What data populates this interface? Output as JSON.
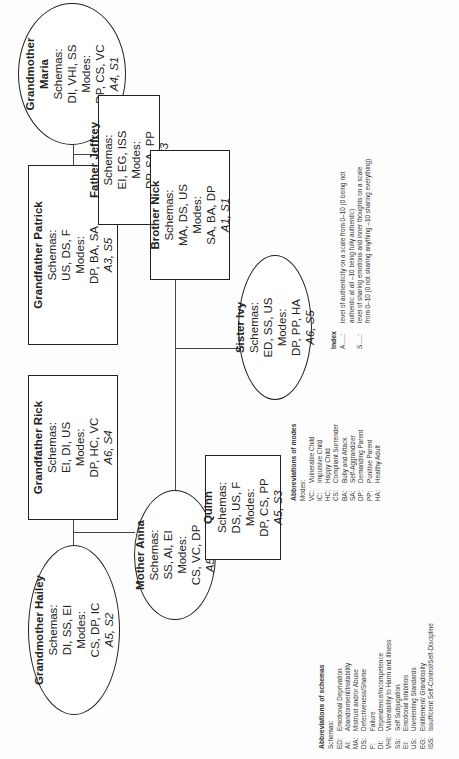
{
  "figure": {
    "members": [
      {
        "id": "hailey",
        "name": "Grandmother Hailey",
        "schemas_label": "Schemas:",
        "schemas": "DI, SS, EI",
        "modes_label": "Modes:",
        "modes": "CS, DP, IC",
        "score": "A5, S2",
        "shape": "ellipse"
      },
      {
        "id": "rick",
        "name": "Grandfather Rick",
        "schemas_label": "Schemas:",
        "schemas": "EI, DI, US",
        "modes_label": "Modes:",
        "modes": "DP, HC, VC",
        "score": "A6, S4",
        "shape": "box"
      },
      {
        "id": "patrick",
        "name": "Grandfather Patrick",
        "schemas_label": "Schemas:",
        "schemas": "US, DS, F",
        "modes_label": "Modes:",
        "modes": "DP, BA, SA",
        "score": "A3, S5",
        "shape": "box"
      },
      {
        "id": "maria",
        "name": "Grandmother Maria",
        "schemas_label": "Schemas:",
        "schemas": "DI, VHI, SS",
        "modes_label": "Modes:",
        "modes": "DP, CS, VC",
        "score": "A4, S1",
        "shape": "ellipse"
      },
      {
        "id": "anna",
        "name": "Mother Anna",
        "schemas_label": "Schemas:",
        "schemas": "SS, AI, EI",
        "modes_label": "Modes:",
        "modes": "CS, VC, DP",
        "score": "A5, S4",
        "shape": "ellipse"
      },
      {
        "id": "jeffrey",
        "name": "Father Jeffrey",
        "schemas_label": "Schemas:",
        "schemas": "EI, EG, ISS",
        "modes_label": "Modes:",
        "modes": "DP, SA, PP",
        "score": "A2, S3",
        "shape": "box"
      },
      {
        "id": "quinn",
        "name": "Quinn",
        "schemas_label": "Schemas:",
        "schemas": "DS, US, F",
        "modes_label": "Modes:",
        "modes": "DP, CS, PP",
        "score": "A5, S3",
        "shape": "box"
      },
      {
        "id": "ivy",
        "name": "Sister Ivy",
        "schemas_label": "Schemas:",
        "schemas": "ED, SS, US",
        "modes_label": "Modes:",
        "modes": "DP, PP, HA",
        "score": "A6, S5",
        "shape": "ellipse"
      },
      {
        "id": "nick",
        "name": "Brother Nick",
        "schemas_label": "Schemas:",
        "schemas": "MA, DS, US",
        "modes_label": "Modes:",
        "modes": "SA, BA, DP",
        "score": "A1, S1",
        "shape": "box"
      }
    ]
  },
  "legend_schemas": {
    "title": "Abbreviations of schemas",
    "subtitle": "Schemas:",
    "items": [
      {
        "abbr": "ED:",
        "label": "Emotional Deprivation"
      },
      {
        "abbr": "AI:",
        "label": "Abandonment/Instability"
      },
      {
        "abbr": "MA:",
        "label": "Mistrust and/or Abuse"
      },
      {
        "abbr": "DS:",
        "label": "Defectiveness/Shame"
      },
      {
        "abbr": "F:",
        "label": "Failure"
      },
      {
        "abbr": "DI:",
        "label": "Dependence/Incompetence"
      },
      {
        "abbr": "VHI:",
        "label": "Vulnerability to Harm and Illness"
      },
      {
        "abbr": "SS:",
        "label": "Self Subjugation"
      },
      {
        "abbr": "EI:",
        "label": "Emotional Inhibition"
      },
      {
        "abbr": "US:",
        "label": "Unrelenting Standards"
      },
      {
        "abbr": "EG:",
        "label": "Entitlement/ Grandiosity"
      },
      {
        "abbr": "ISS:",
        "label": "Issufficient Self-Control/Self-Discipline"
      }
    ]
  },
  "legend_modes": {
    "title": "Abbreviations of modes",
    "subtitle": "Modes:",
    "items": [
      {
        "abbr": "VC:",
        "label": "Vulnerable Child"
      },
      {
        "abbr": "IC:",
        "label": "Impulsive Child"
      },
      {
        "abbr": "HC:",
        "label": "Happy Child"
      },
      {
        "abbr": "CS:",
        "label": "Compliant Surrender"
      },
      {
        "abbr": "BA:",
        "label": "Bully and Attack"
      },
      {
        "abbr": "SA:",
        "label": "Self-Aggrandizer"
      },
      {
        "abbr": "DP:",
        "label": "Demanding Parent"
      },
      {
        "abbr": "PP:",
        "label": "Punitive Parent"
      },
      {
        "abbr": "HA:",
        "label": "Healthy Adult"
      }
    ]
  },
  "legend_index": {
    "title": "Index",
    "items": [
      {
        "abbr": "A.....:",
        "lines": [
          "level of authenticity on a scale from 0–10 (0 being not",
          "authentic at all –10 being fully authentic)"
        ]
      },
      {
        "abbr": "S.....:",
        "lines": [
          "level of sharing emotions and inner thoughts on a scale",
          "from 0–10 (0 not sharing anything –10 sharing everything)"
        ]
      }
    ]
  }
}
